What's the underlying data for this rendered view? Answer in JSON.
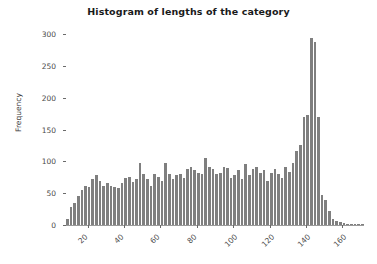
{
  "chart_data": {
    "type": "bar",
    "title": "Histogram of lengths of the category",
    "xlabel": "",
    "ylabel": "Frequency",
    "ylim": [
      0,
      310
    ],
    "xlim": [
      8,
      172
    ],
    "grid": false,
    "legend": null,
    "bar_color": "#7f7f7f",
    "yticks": [
      0,
      50,
      100,
      150,
      200,
      250,
      300
    ],
    "ytick_labels": [
      "0",
      "50",
      "100",
      "150",
      "200",
      "250",
      "300"
    ],
    "xticks": [
      20,
      40,
      60,
      80,
      100,
      120,
      140,
      160
    ],
    "xtick_labels": [
      "20",
      "40",
      "60",
      "80",
      "100",
      "120",
      "140",
      "160"
    ],
    "bin_width": 2,
    "bin_centers": [
      9,
      11,
      13,
      15,
      17,
      19,
      21,
      23,
      25,
      27,
      29,
      31,
      33,
      35,
      37,
      39,
      41,
      43,
      45,
      47,
      49,
      51,
      53,
      55,
      57,
      59,
      61,
      63,
      65,
      67,
      69,
      71,
      73,
      75,
      77,
      79,
      81,
      83,
      85,
      87,
      89,
      91,
      93,
      95,
      97,
      99,
      101,
      103,
      105,
      107,
      109,
      111,
      113,
      115,
      117,
      119,
      121,
      123,
      125,
      127,
      129,
      131,
      133,
      135,
      137,
      139,
      141,
      143,
      145,
      147,
      149,
      151,
      153,
      155,
      157,
      159,
      161,
      163,
      165,
      167,
      169,
      171
    ],
    "values": [
      10,
      28,
      34,
      45,
      55,
      62,
      60,
      72,
      78,
      70,
      62,
      66,
      62,
      60,
      58,
      66,
      74,
      75,
      68,
      72,
      97,
      80,
      72,
      62,
      80,
      76,
      70,
      97,
      80,
      72,
      78,
      80,
      74,
      88,
      92,
      86,
      82,
      80,
      105,
      92,
      88,
      80,
      82,
      92,
      90,
      74,
      78,
      86,
      72,
      96,
      78,
      88,
      92,
      82,
      86,
      70,
      82,
      88,
      80,
      74,
      92,
      84,
      98,
      116,
      126,
      170,
      173,
      294,
      288,
      170,
      48,
      40,
      22,
      10,
      6,
      4,
      3,
      2,
      2,
      1,
      1,
      1
    ]
  }
}
